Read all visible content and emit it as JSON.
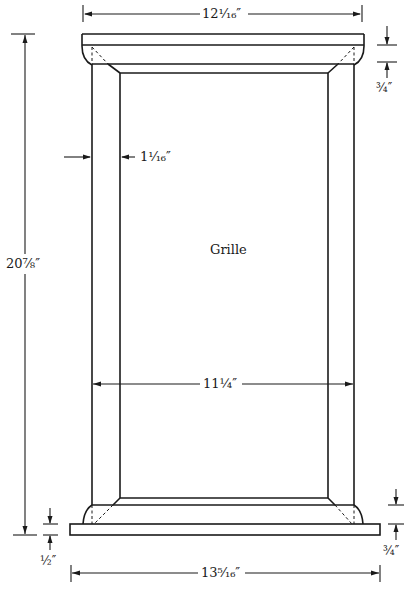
{
  "figure": {
    "part_label": "Grille",
    "dimensions": {
      "top_width": "12¹⁄₁₆″",
      "top_cap_height": "¾″",
      "stile_width": "1¹⁄₁₆″",
      "overall_height": "20⅞″",
      "inner_width": "11¼″",
      "base_thickness": "½″",
      "bottom_rail_height": "¾″",
      "bottom_width": "13⁵⁄₁₆″"
    },
    "colors": {
      "line": "#1a1a1a",
      "background": "#ffffff"
    }
  }
}
